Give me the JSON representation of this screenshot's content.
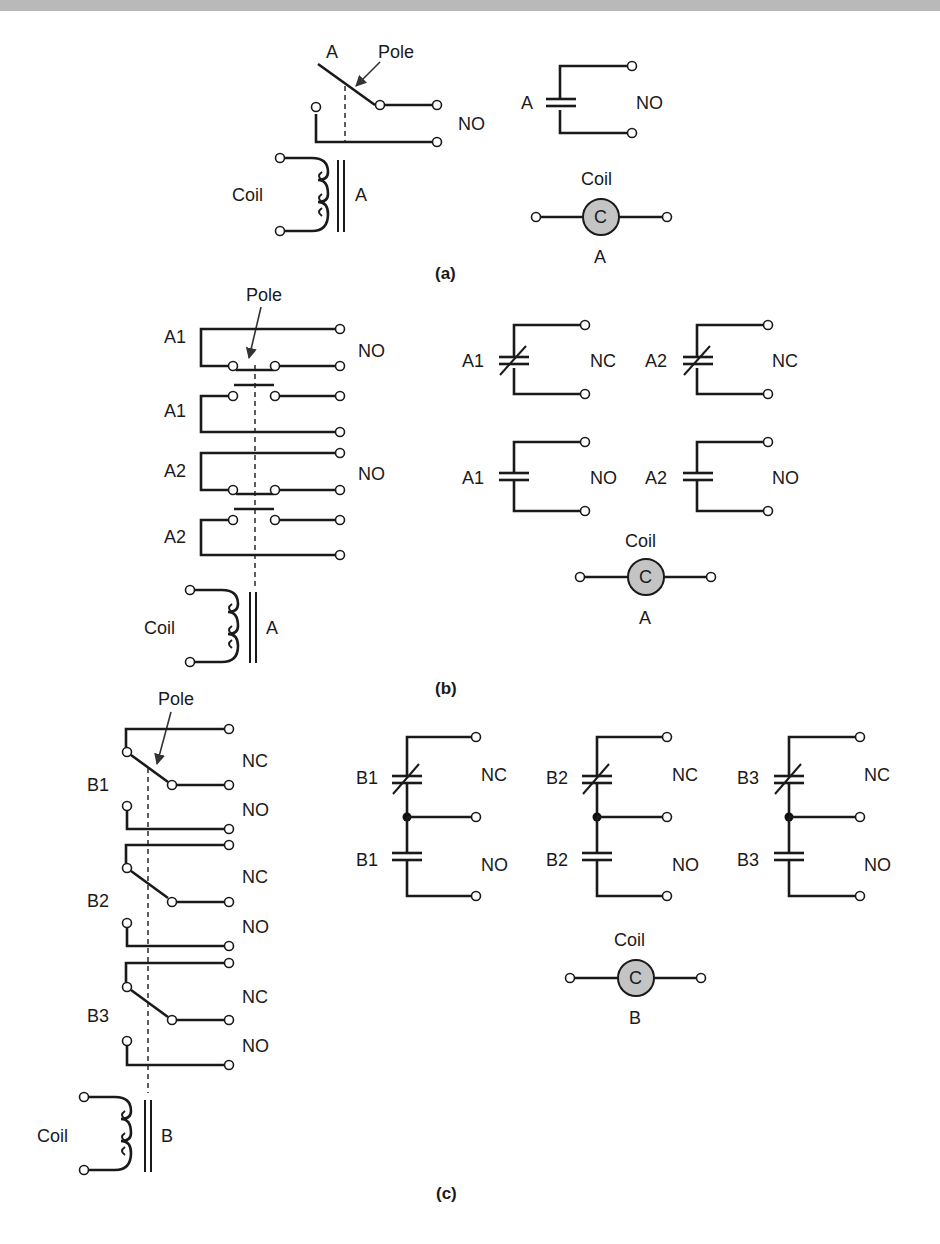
{
  "figure": {
    "panels": [
      {
        "id": "a",
        "caption": "(a)",
        "pictorial": {
          "contact_label": "A",
          "pole_label": "Pole",
          "contact_type": "NO",
          "coil_label": "Coil",
          "coil_id": "A"
        },
        "schematic": {
          "contacts": [
            {
              "label": "A",
              "type": "NO"
            }
          ],
          "coil": {
            "title": "Coil",
            "symbol": "C",
            "id": "A"
          }
        }
      },
      {
        "id": "b",
        "caption": "(b)",
        "pictorial": {
          "pole_label": "Pole",
          "contacts": [
            {
              "label": "A1",
              "type": "NO"
            },
            {
              "label": "A1",
              "type": ""
            },
            {
              "label": "A2",
              "type": "NO"
            },
            {
              "label": "A2",
              "type": ""
            }
          ],
          "coil_label": "Coil",
          "coil_id": "A"
        },
        "schematic": {
          "contacts": [
            {
              "label": "A1",
              "type": "NC"
            },
            {
              "label": "A2",
              "type": "NC"
            },
            {
              "label": "A1",
              "type": "NO"
            },
            {
              "label": "A2",
              "type": "NO"
            }
          ],
          "coil": {
            "title": "Coil",
            "symbol": "C",
            "id": "A"
          }
        }
      },
      {
        "id": "c",
        "caption": "(c)",
        "pictorial": {
          "pole_label": "Pole",
          "contacts": [
            {
              "label": "B1",
              "types": [
                "NC",
                "NO"
              ]
            },
            {
              "label": "B2",
              "types": [
                "NC",
                "NO"
              ]
            },
            {
              "label": "B3",
              "types": [
                "NC",
                "NO"
              ]
            }
          ],
          "coil_label": "Coil",
          "coil_id": "B"
        },
        "schematic": {
          "contacts": [
            {
              "label": "B1",
              "nc": "NC",
              "no": "NO"
            },
            {
              "label": "B2",
              "nc": "NC",
              "no": "NO"
            },
            {
              "label": "B3",
              "nc": "NC",
              "no": "NO"
            }
          ],
          "coil": {
            "title": "Coil",
            "symbol": "C",
            "id": "B"
          }
        }
      }
    ],
    "colors": {
      "line": "#1a1a1a",
      "coil_fill": "#c4c4c4",
      "header_bar": "#b9b9b9"
    }
  }
}
